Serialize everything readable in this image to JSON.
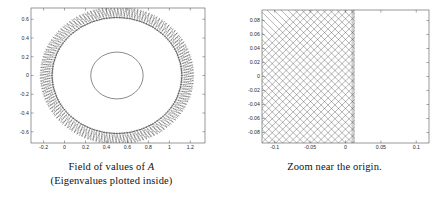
{
  "figure": {
    "background": "#ffffff",
    "ink": "#1a1a1a"
  },
  "panels": [
    {
      "id": "field-of-values",
      "caption_lines": [
        "Field of values of ",
        "(Eigenvalues plotted inside)"
      ],
      "caption_math": "A"
    },
    {
      "id": "zoom-near-origin",
      "caption_lines": [
        "Zoom near the origin."
      ],
      "caption_math": ""
    }
  ],
  "chart_data": [
    {
      "type": "scatter",
      "id": "field-of-values",
      "title": "Field of values of A (Eigenvalues plotted inside)",
      "xlabel": "",
      "ylabel": "",
      "xlim": [
        -0.32,
        1.34
      ],
      "ylim": [
        -0.72,
        0.72
      ],
      "xticks": [
        -0.2,
        0,
        0.2,
        0.4,
        0.6,
        0.8,
        1,
        1.2
      ],
      "xticklabels": [
        "-0.2",
        "0",
        "0.2",
        "0.4",
        "0.6",
        "0.8",
        "1",
        "1.2"
      ],
      "yticks": [
        -0.6,
        -0.4,
        -0.2,
        0,
        0.2,
        0.4,
        0.6
      ],
      "yticklabels": [
        "-0.6",
        "-0.4",
        "-0.2",
        "0",
        "0.2",
        "0.4",
        "0.6"
      ],
      "grid": false,
      "legend": null,
      "box": true,
      "series": [
        {
          "name": "field-of-values-boundary",
          "kind": "circle",
          "center": [
            0.5,
            0.0
          ],
          "radius": 0.62,
          "style": "solid"
        },
        {
          "name": "eigenvalue-ring-inner",
          "kind": "circle",
          "center": [
            0.5,
            0.0
          ],
          "radius": 0.25,
          "style": "solid"
        },
        {
          "name": "eigenvalue-dotted-rings",
          "kind": "dotted-annuli",
          "center": [
            0.5,
            0.0
          ],
          "radii": [
            0.62,
            0.645,
            0.665,
            0.685,
            0.705,
            0.725
          ],
          "markers_per_ring": 160,
          "style": "dotted"
        }
      ]
    },
    {
      "type": "line",
      "id": "zoom-near-origin",
      "title": "Zoom near the origin.",
      "xlabel": "",
      "ylabel": "",
      "xlim": [
        -0.118,
        0.118
      ],
      "ylim": [
        -0.095,
        0.095
      ],
      "xticks": [
        -0.1,
        -0.05,
        0,
        0.05,
        0.1
      ],
      "xticklabels": [
        "-0.1",
        "-0.05",
        "0",
        "0.05",
        "0.1"
      ],
      "yticks": [
        -0.08,
        -0.06,
        -0.04,
        -0.02,
        0,
        0.02,
        0.04,
        0.06,
        0.08
      ],
      "yticklabels": [
        "-0.08",
        "-0.06",
        "-0.04",
        "-0.02",
        "0",
        "0.02",
        "0.04",
        "0.06",
        "0.08"
      ],
      "grid": false,
      "legend": null,
      "box": true,
      "series": [
        {
          "name": "crosshatch-up",
          "kind": "diagonal-lines",
          "slope": 1.0,
          "x_extent": [
            -0.118,
            0.013
          ],
          "count": 26,
          "style": "solid-thin"
        },
        {
          "name": "crosshatch-down",
          "kind": "diagonal-lines",
          "slope": -1.0,
          "x_extent": [
            -0.118,
            0.013
          ],
          "count": 26,
          "style": "solid-thin"
        },
        {
          "name": "right-boundary-accumulation",
          "kind": "vertical-dense-edge",
          "x": 0.013,
          "style": "dense"
        }
      ]
    }
  ]
}
